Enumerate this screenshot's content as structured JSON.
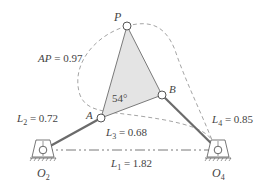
{
  "diagram": {
    "type": "four-bar linkage with coupler point",
    "points": {
      "P": {
        "label": "P",
        "x": 127,
        "y": 26
      },
      "A": {
        "label": "A",
        "x": 101,
        "y": 118
      },
      "B": {
        "label": "B",
        "x": 162,
        "y": 95
      },
      "O2": {
        "label": "O",
        "sub": "2",
        "x": 43,
        "y": 150
      },
      "O4": {
        "label": "O",
        "sub": "4",
        "x": 218,
        "y": 150
      }
    },
    "links": {
      "L1": {
        "name": "L",
        "sub": "1",
        "eq": " = 1.82"
      },
      "L2": {
        "name": "L",
        "sub": "2",
        "eq": " = 0.72"
      },
      "L3": {
        "name": "L",
        "sub": "3",
        "eq": " = 0.68"
      },
      "L4": {
        "name": "L",
        "sub": "4",
        "eq": " = 0.85"
      },
      "AP": {
        "name": "AP",
        "eq": " = 0.97"
      }
    },
    "angle": {
      "label": "54°"
    },
    "colors": {
      "link": "#6b6b6b",
      "coupler_fill": "#e4e4e4",
      "dashed": "#999999",
      "text": "#444444"
    }
  }
}
